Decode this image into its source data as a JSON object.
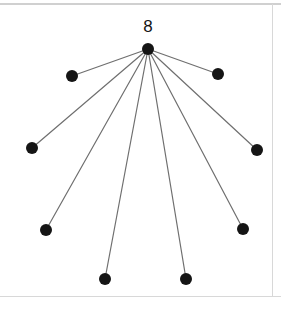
{
  "figure": {
    "title_label": "8",
    "canvas": {
      "width": 281,
      "height": 309,
      "background": "#ffffff"
    },
    "colors": {
      "node": "#151515",
      "edge": "#6f6f6f",
      "label": "#141414",
      "frame": "#d8d8d8",
      "frame_top": "#d0d0d0"
    }
  },
  "chart_data": {
    "type": "diagram",
    "graph_type": "star",
    "title": "8",
    "xlabel": "",
    "ylabel": "",
    "grid": false,
    "legend": false,
    "node_count": 9,
    "edge_count": 8,
    "hub_degree": 8,
    "hub_label": "8",
    "node_radius_px": 6,
    "nodes": [
      {
        "id": "hub",
        "label": "8",
        "x": 148,
        "y": 49,
        "role": "center",
        "degree": 8
      },
      {
        "id": "leaf-1",
        "label": "",
        "x": 72,
        "y": 76,
        "role": "leaf",
        "degree": 1
      },
      {
        "id": "leaf-2",
        "label": "",
        "x": 218,
        "y": 74,
        "role": "leaf",
        "degree": 1
      },
      {
        "id": "leaf-3",
        "label": "",
        "x": 32,
        "y": 148,
        "role": "leaf",
        "degree": 1
      },
      {
        "id": "leaf-4",
        "label": "",
        "x": 257,
        "y": 150,
        "role": "leaf",
        "degree": 1
      },
      {
        "id": "leaf-5",
        "label": "",
        "x": 46,
        "y": 230,
        "role": "leaf",
        "degree": 1
      },
      {
        "id": "leaf-6",
        "label": "",
        "x": 243,
        "y": 229,
        "role": "leaf",
        "degree": 1
      },
      {
        "id": "leaf-7",
        "label": "",
        "x": 105,
        "y": 279,
        "role": "leaf",
        "degree": 1
      },
      {
        "id": "leaf-8",
        "label": "",
        "x": 186,
        "y": 279,
        "role": "leaf",
        "degree": 1
      }
    ],
    "edges": [
      {
        "source": "hub",
        "target": "leaf-1"
      },
      {
        "source": "hub",
        "target": "leaf-2"
      },
      {
        "source": "hub",
        "target": "leaf-3"
      },
      {
        "source": "hub",
        "target": "leaf-4"
      },
      {
        "source": "hub",
        "target": "leaf-5"
      },
      {
        "source": "hub",
        "target": "leaf-6"
      },
      {
        "source": "hub",
        "target": "leaf-7"
      },
      {
        "source": "hub",
        "target": "leaf-8"
      }
    ],
    "label_position": {
      "x": 148,
      "y": 32
    },
    "frame_lines": [
      {
        "orientation": "horizontal",
        "y": 4,
        "x1": 0,
        "x2": 281
      },
      {
        "orientation": "horizontal",
        "y": 296,
        "x1": 0,
        "x2": 281
      },
      {
        "orientation": "vertical",
        "x": 272,
        "y1": 4,
        "y2": 296
      }
    ]
  }
}
